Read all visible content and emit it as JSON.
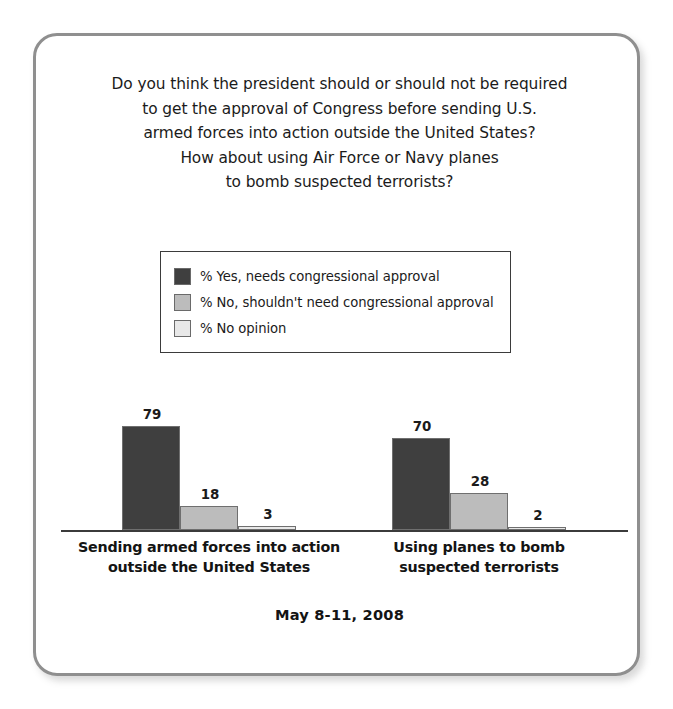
{
  "card": {
    "border_color": "#8f8f8f",
    "background": "#ffffff"
  },
  "title": {
    "lines": [
      "Do you think the president should or should not be required",
      "to get the approval of Congress before sending U.S.",
      "armed forces into action outside the United States?",
      "How about using Air Force or Navy planes",
      "to bomb suspected terrorists?"
    ]
  },
  "legend": {
    "items": [
      {
        "label": "% Yes, needs congressional approval",
        "color": "#3f3f3f"
      },
      {
        "label": "% No, shouldn't need congressional approval",
        "color": "#bcbcbc"
      },
      {
        "label": "% No opinion",
        "color": "#e8e8e8"
      }
    ]
  },
  "footer": {
    "date": "May 8-11, 2008"
  },
  "chart_data": {
    "type": "bar",
    "subtitle": "May 8-11, 2008",
    "xlabel": "",
    "ylabel": "",
    "ylim": [
      0,
      100
    ],
    "grid": false,
    "legend_position": "top-center",
    "value_labels": true,
    "categories": [
      "Sending armed forces into action outside the United States",
      "Using planes to bomb suspected terrorists"
    ],
    "category_lines": [
      [
        "Sending armed forces into action",
        "outside the United States"
      ],
      [
        "Using planes to bomb",
        "suspected terrorists"
      ]
    ],
    "series": [
      {
        "name": "% Yes, needs congressional approval",
        "color": "#3f3f3f",
        "values": [
          79,
          70
        ]
      },
      {
        "name": "% No, shouldn't need congressional approval",
        "color": "#bcbcbc",
        "values": [
          18,
          28
        ]
      },
      {
        "name": "% No opinion",
        "color": "#e8e8e8",
        "values": [
          3,
          2
        ]
      }
    ]
  }
}
